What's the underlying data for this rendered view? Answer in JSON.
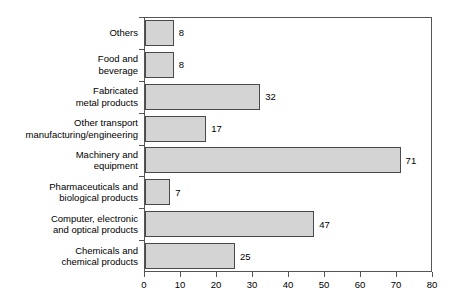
{
  "chart_data": {
    "type": "bar",
    "orientation": "horizontal",
    "title": "",
    "subtitle": "",
    "xlabel": "",
    "ylabel": "",
    "xlim": [
      0,
      80
    ],
    "xticks": [
      0,
      10,
      20,
      30,
      40,
      50,
      60,
      70,
      80
    ],
    "xtick_labels": [
      "0",
      "10",
      "20",
      "30",
      "40",
      "50",
      "60",
      "70",
      "80"
    ],
    "grid": false,
    "legend": null,
    "legend_position": "none",
    "categories": [
      "Others",
      "Food and beverage",
      "Fabricated metal products",
      "Other transport manufacturing/engineering",
      "Machinery and equipment",
      "Pharmaceuticals and biological products",
      "Computer, electronic and optical products",
      "Chemicals and chemical products"
    ],
    "category_label_lines": [
      [
        "Others"
      ],
      [
        "Food and",
        "beverage"
      ],
      [
        "Fabricated",
        "metal products"
      ],
      [
        "Other transport",
        "manufacturing/engineering"
      ],
      [
        "Machinery and",
        "equipment"
      ],
      [
        "Pharmaceuticals and",
        "biological products"
      ],
      [
        "Computer, electronic",
        "and optical products"
      ],
      [
        "Chemicals and",
        "chemical products"
      ]
    ],
    "values": [
      8,
      8,
      32,
      17,
      71,
      7,
      47,
      25
    ],
    "value_labels": [
      "8",
      "8",
      "32",
      "17",
      "71",
      "7",
      "47",
      "25"
    ],
    "colors": {
      "bar_fill": "#d4d4d4",
      "bar_stroke": "#4a4a4a",
      "axis": "#555555",
      "text": "#000000",
      "background": "#ffffff"
    }
  }
}
